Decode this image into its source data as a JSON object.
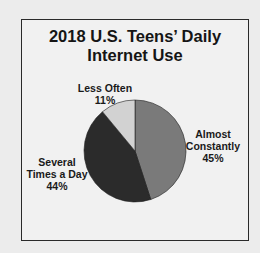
{
  "chart_data": {
    "type": "pie",
    "title_lines": [
      "2018 U.S. Teens’ Daily",
      "Internet Use"
    ],
    "slices": [
      {
        "label": "Almost Constantly",
        "label_lines": [
          "Almost",
          "Constantly"
        ],
        "value": 45,
        "value_text": "45%",
        "color": "#7a7a7a"
      },
      {
        "label": "Several Times a Day",
        "label_lines": [
          "Several",
          "Times a Day"
        ],
        "value": 44,
        "value_text": "44%",
        "color": "#2b2b2b"
      },
      {
        "label": "Less Often",
        "label_lines": [
          "Less Often"
        ],
        "value": 11,
        "value_text": "11%",
        "color": "#d2d2d2"
      }
    ],
    "legend": "none (direct labels)",
    "start_angle": "12 o'clock, clockwise"
  }
}
